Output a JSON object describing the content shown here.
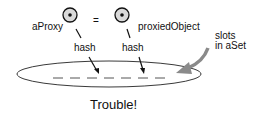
{
  "diagram": {
    "left_label": "aProxy",
    "equals": "=",
    "right_label": "proxiedObject",
    "hash_left": "hash",
    "hash_right": "hash",
    "slots_label_line1": "slots",
    "slots_label_line2": "in aSet",
    "caption": "Trouble!"
  },
  "colors": {
    "ink": "#111111",
    "circle_fill": "#d9d9d9",
    "arrow_gray": "#8a8a8a"
  }
}
